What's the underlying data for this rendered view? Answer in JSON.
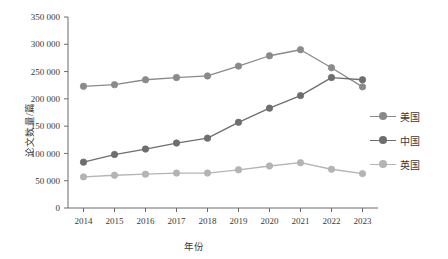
{
  "chart_data": {
    "type": "line",
    "title": "",
    "subtitle": "",
    "xlabel": "年份",
    "ylabel": "论文数量/篇",
    "x": [
      "2014",
      "2015",
      "2016",
      "2017",
      "2018",
      "2019",
      "2020",
      "2021",
      "2022",
      "2023"
    ],
    "categories": [
      "2014",
      "2015",
      "2016",
      "2017",
      "2018",
      "2019",
      "2020",
      "2021",
      "2022",
      "2023"
    ],
    "ylim": [
      0,
      350000
    ],
    "ytick_step": 50000,
    "ytick_labels": [
      "0",
      "50 000",
      "100 000",
      "150 000",
      "200 000",
      "250 000",
      "300 000",
      "350 000"
    ],
    "ytick_values": [
      0,
      50000,
      100000,
      150000,
      200000,
      250000,
      300000,
      350000
    ],
    "xtick_labels": [
      "2014",
      "2015",
      "2016",
      "2017",
      "2018",
      "2019",
      "2020",
      "2021",
      "2022",
      "2023"
    ],
    "grid": false,
    "legend_position": "right",
    "marker": "circle",
    "series": [
      {
        "name": "美国",
        "color": "#8a8a8a",
        "values": [
          223000,
          226000,
          235000,
          239000,
          242000,
          260000,
          279000,
          290000,
          257000,
          222000
        ]
      },
      {
        "name": "中国",
        "color": "#6e6e6e",
        "values": [
          84000,
          98000,
          108000,
          119000,
          128000,
          157000,
          183000,
          206000,
          239000,
          235000
        ]
      },
      {
        "name": "英国",
        "color": "#b4b4b4",
        "values": [
          57000,
          60000,
          62000,
          64000,
          64000,
          70000,
          77000,
          83000,
          71000,
          63000
        ]
      }
    ]
  },
  "legend": {
    "items": [
      {
        "label": "美国",
        "color": "#8a8a8a"
      },
      {
        "label": "中国",
        "color": "#6e6e6e"
      },
      {
        "label": "英国",
        "color": "#b4b4b4"
      }
    ]
  },
  "axes": {
    "x_title": "年份",
    "y_title": "论文数量/篇"
  },
  "colors": {
    "axis": "#6b6b6b",
    "text": "#3a3a3a",
    "background": "#ffffff"
  }
}
